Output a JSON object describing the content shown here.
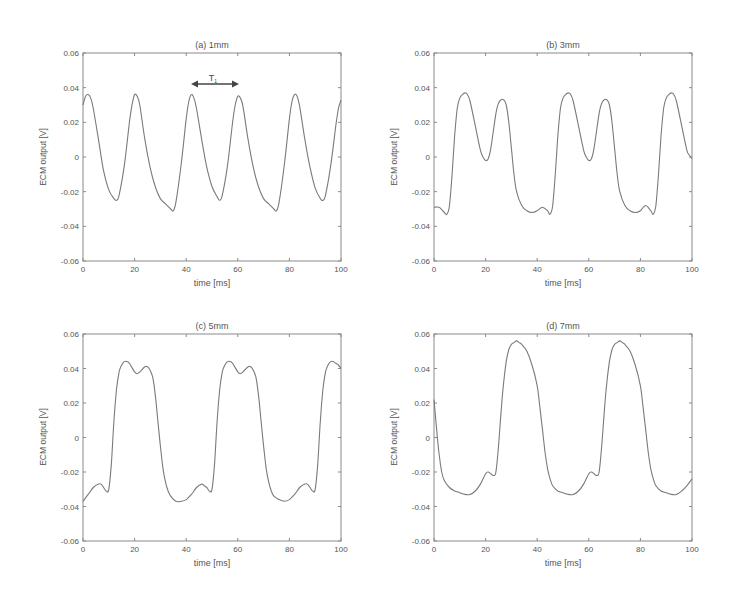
{
  "figure": {
    "background": "#ffffff",
    "line_color": "#7a7a7a",
    "axis_color": "#8a8a8a"
  },
  "chart_data": [
    {
      "id": "a",
      "type": "line",
      "title": "(a) 1mm",
      "xlabel": "time [ms]",
      "ylabel": "ECM output [V]",
      "xlim": [
        0,
        100
      ],
      "ylim": [
        -0.06,
        0.06
      ],
      "xticks": [
        0,
        20,
        40,
        60,
        80,
        100
      ],
      "xtick_labels": [
        "0",
        "20",
        "40",
        "60",
        "80",
        "100"
      ],
      "yticks": [
        -0.06,
        -0.04,
        -0.02,
        0,
        0.02,
        0.04,
        0.06
      ],
      "ytick_labels": [
        "-0.06",
        "-0.04",
        "-0.02",
        "0",
        "0.02",
        "0.04",
        "0.06"
      ],
      "grid": false,
      "annotation": {
        "text": "T",
        "subscript": "1",
        "x_start": 42,
        "x_end": 60,
        "y": 0.043
      },
      "series": [
        {
          "name": "1mm",
          "x": [
            0,
            1,
            2,
            3,
            4,
            6,
            8,
            10,
            12,
            13,
            14,
            16,
            18,
            19,
            20,
            21,
            22,
            24,
            26,
            28,
            30,
            32,
            34,
            35,
            36,
            38,
            40,
            41,
            42,
            43,
            44,
            46,
            48,
            50,
            52,
            53,
            54,
            56,
            58,
            59,
            60,
            61,
            62,
            64,
            66,
            68,
            70,
            72,
            74,
            75,
            76,
            78,
            80,
            81,
            82,
            83,
            84,
            86,
            88,
            90,
            92,
            93,
            94,
            96,
            98,
            99,
            100
          ],
          "y": [
            0.03,
            0.035,
            0.036,
            0.034,
            0.028,
            0.01,
            -0.008,
            -0.019,
            -0.024,
            -0.025,
            -0.022,
            -0.005,
            0.02,
            0.03,
            0.036,
            0.035,
            0.03,
            0.01,
            -0.006,
            -0.017,
            -0.024,
            -0.027,
            -0.03,
            -0.031,
            -0.026,
            -0.005,
            0.022,
            0.032,
            0.036,
            0.034,
            0.028,
            0.01,
            -0.006,
            -0.017,
            -0.023,
            -0.025,
            -0.022,
            -0.005,
            0.02,
            0.03,
            0.035,
            0.034,
            0.029,
            0.01,
            -0.006,
            -0.017,
            -0.024,
            -0.027,
            -0.03,
            -0.031,
            -0.026,
            -0.005,
            0.022,
            0.032,
            0.036,
            0.035,
            0.029,
            0.01,
            -0.006,
            -0.018,
            -0.024,
            -0.025,
            -0.022,
            -0.005,
            0.018,
            0.028,
            0.033
          ]
        }
      ]
    },
    {
      "id": "b",
      "type": "line",
      "title": "(b) 3mm",
      "xlabel": "time [ms]",
      "ylabel": "ECM output [V]",
      "xlim": [
        0,
        100
      ],
      "ylim": [
        -0.06,
        0.06
      ],
      "xticks": [
        0,
        20,
        40,
        60,
        80,
        100
      ],
      "xtick_labels": [
        "0",
        "20",
        "40",
        "60",
        "80",
        "100"
      ],
      "yticks": [
        -0.06,
        -0.04,
        -0.02,
        0,
        0.02,
        0.04,
        0.06
      ],
      "ytick_labels": [
        "-0.06",
        "-0.04",
        "-0.02",
        "0",
        "0.02",
        "0.04",
        "0.06"
      ],
      "grid": false,
      "series": [
        {
          "name": "3mm",
          "x": [
            0,
            2,
            4,
            5,
            6,
            7,
            8,
            9,
            10,
            11,
            12,
            13,
            14,
            16,
            18,
            19,
            20,
            21,
            22,
            24,
            25,
            26,
            27,
            28,
            29,
            30,
            31,
            32,
            34,
            36,
            38,
            40,
            42,
            44,
            45,
            46,
            47,
            48,
            49,
            50,
            51,
            52,
            53,
            54,
            56,
            58,
            59,
            60,
            61,
            62,
            64,
            65,
            66,
            67,
            68,
            69,
            70,
            71,
            72,
            74,
            76,
            78,
            80,
            82,
            84,
            85,
            86,
            87,
            88,
            89,
            90,
            91,
            92,
            93,
            94,
            96,
            98,
            99,
            100
          ],
          "y": [
            -0.029,
            -0.029,
            -0.032,
            -0.033,
            -0.028,
            -0.01,
            0.012,
            0.028,
            0.034,
            0.036,
            0.037,
            0.036,
            0.032,
            0.018,
            0.004,
            0.0,
            -0.002,
            -0.001,
            0.005,
            0.025,
            0.031,
            0.033,
            0.033,
            0.03,
            0.02,
            0.005,
            -0.01,
            -0.02,
            -0.028,
            -0.031,
            -0.032,
            -0.031,
            -0.029,
            -0.031,
            -0.033,
            -0.028,
            -0.01,
            0.012,
            0.028,
            0.034,
            0.036,
            0.037,
            0.036,
            0.032,
            0.018,
            0.004,
            0.0,
            -0.002,
            -0.001,
            0.005,
            0.025,
            0.031,
            0.033,
            0.033,
            0.03,
            0.02,
            0.005,
            -0.01,
            -0.02,
            -0.028,
            -0.031,
            -0.032,
            -0.031,
            -0.028,
            -0.031,
            -0.033,
            -0.028,
            -0.01,
            0.012,
            0.028,
            0.034,
            0.036,
            0.037,
            0.036,
            0.032,
            0.018,
            0.004,
            0.001,
            -0.001
          ]
        }
      ]
    },
    {
      "id": "c",
      "type": "line",
      "title": "(c) 5mm",
      "xlabel": "time [ms]",
      "ylabel": "ECM output [V]",
      "xlim": [
        0,
        100
      ],
      "ylim": [
        -0.06,
        0.06
      ],
      "xticks": [
        0,
        20,
        40,
        60,
        80,
        100
      ],
      "xtick_labels": [
        "0",
        "20",
        "40",
        "60",
        "80",
        "100"
      ],
      "yticks": [
        -0.06,
        -0.04,
        -0.02,
        0,
        0.02,
        0.04,
        0.06
      ],
      "ytick_labels": [
        "-0.06",
        "-0.04",
        "-0.02",
        "0",
        "0.02",
        "0.04",
        "0.06"
      ],
      "grid": false,
      "series": [
        {
          "name": "5mm",
          "x": [
            0,
            2,
            4,
            6,
            7,
            8,
            9,
            10,
            11,
            12,
            13,
            14,
            15,
            16,
            17,
            18,
            20,
            21,
            22,
            24,
            25,
            26,
            27,
            28,
            29,
            30,
            31,
            32,
            33,
            34,
            36,
            38,
            40,
            42,
            44,
            46,
            47,
            48,
            49,
            50,
            51,
            52,
            53,
            54,
            55,
            56,
            57,
            58,
            60,
            61,
            62,
            64,
            65,
            66,
            67,
            68,
            69,
            70,
            71,
            72,
            73,
            74,
            76,
            78,
            80,
            82,
            84,
            86,
            87,
            88,
            89,
            90,
            91,
            92,
            93,
            94,
            95,
            96,
            97,
            98,
            99,
            100
          ],
          "y": [
            -0.037,
            -0.033,
            -0.029,
            -0.027,
            -0.027,
            -0.029,
            -0.031,
            -0.03,
            -0.015,
            0.01,
            0.028,
            0.038,
            0.042,
            0.044,
            0.044,
            0.043,
            0.038,
            0.037,
            0.038,
            0.041,
            0.041,
            0.039,
            0.035,
            0.025,
            0.01,
            -0.005,
            -0.018,
            -0.026,
            -0.031,
            -0.034,
            -0.037,
            -0.037,
            -0.036,
            -0.033,
            -0.029,
            -0.027,
            -0.028,
            -0.029,
            -0.031,
            -0.03,
            -0.015,
            0.01,
            0.028,
            0.038,
            0.042,
            0.044,
            0.044,
            0.043,
            0.038,
            0.037,
            0.038,
            0.041,
            0.041,
            0.039,
            0.035,
            0.025,
            0.01,
            -0.005,
            -0.018,
            -0.026,
            -0.031,
            -0.034,
            -0.036,
            -0.037,
            -0.036,
            -0.033,
            -0.029,
            -0.027,
            -0.027,
            -0.029,
            -0.031,
            -0.03,
            -0.015,
            0.01,
            0.028,
            0.038,
            0.042,
            0.044,
            0.044,
            0.043,
            0.042,
            0.04
          ]
        }
      ]
    },
    {
      "id": "d",
      "type": "line",
      "title": "(d) 7mm",
      "xlabel": "time [ms]",
      "ylabel": "ECM output [V]",
      "xlim": [
        0,
        100
      ],
      "ylim": [
        -0.06,
        0.06
      ],
      "xticks": [
        0,
        20,
        40,
        60,
        80,
        100
      ],
      "xtick_labels": [
        "0",
        "20",
        "40",
        "60",
        "80",
        "100"
      ],
      "yticks": [
        -0.06,
        -0.04,
        -0.02,
        0,
        0.02,
        0.04,
        0.06
      ],
      "ytick_labels": [
        "-0.06",
        "-0.04",
        "-0.02",
        "0",
        "0.02",
        "0.04",
        "0.06"
      ],
      "grid": false,
      "series": [
        {
          "name": "7mm",
          "x": [
            0,
            1,
            2,
            3,
            4,
            6,
            8,
            10,
            12,
            14,
            16,
            18,
            20,
            21,
            22,
            23,
            24,
            25,
            26,
            27,
            28,
            29,
            30,
            31,
            32,
            33,
            34,
            36,
            38,
            40,
            41,
            42,
            43,
            44,
            45,
            46,
            48,
            50,
            52,
            54,
            56,
            58,
            60,
            61,
            62,
            63,
            64,
            65,
            66,
            67,
            68,
            69,
            70,
            71,
            72,
            73,
            74,
            76,
            78,
            80,
            81,
            82,
            83,
            84,
            85,
            86,
            88,
            90,
            92,
            94,
            96,
            98,
            100
          ],
          "y": [
            0.022,
            0.005,
            -0.01,
            -0.02,
            -0.025,
            -0.029,
            -0.031,
            -0.032,
            -0.033,
            -0.033,
            -0.031,
            -0.027,
            -0.021,
            -0.02,
            -0.021,
            -0.022,
            -0.02,
            -0.005,
            0.015,
            0.032,
            0.044,
            0.051,
            0.054,
            0.055,
            0.056,
            0.055,
            0.054,
            0.05,
            0.042,
            0.03,
            0.018,
            0.005,
            -0.008,
            -0.018,
            -0.024,
            -0.028,
            -0.031,
            -0.032,
            -0.033,
            -0.033,
            -0.031,
            -0.027,
            -0.021,
            -0.02,
            -0.021,
            -0.022,
            -0.02,
            -0.005,
            0.015,
            0.032,
            0.044,
            0.051,
            0.054,
            0.055,
            0.056,
            0.055,
            0.054,
            0.05,
            0.042,
            0.03,
            0.018,
            0.005,
            -0.008,
            -0.018,
            -0.024,
            -0.028,
            -0.031,
            -0.032,
            -0.033,
            -0.033,
            -0.031,
            -0.028,
            -0.024
          ]
        }
      ]
    }
  ]
}
